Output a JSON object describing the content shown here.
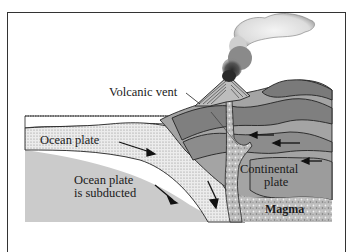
{
  "diagram": {
    "type": "cross-section",
    "labels": {
      "volcanic_vent": "Volcanic vent",
      "ocean_plate": "Ocean plate",
      "ocean_plate_subducted_line1": "Ocean plate",
      "ocean_plate_subducted_line2": "is subducted",
      "continental_plate_line1": "Continental",
      "continental_plate_line2": "plate",
      "magma": "Magma"
    },
    "caption_partial": "",
    "colors": {
      "frame": "#333333",
      "ocean_plate_fill": "#e8e8e8",
      "mantle_fill": "#c8c8c8",
      "continental_fill": "#9a9a9a",
      "continental_dark": "#7a7a7a",
      "continental_light": "#b0b0b0",
      "magma_fill": "#bdbdbd",
      "smoke_dark": "#444444",
      "smoke_light": "#e6e6e6"
    }
  }
}
